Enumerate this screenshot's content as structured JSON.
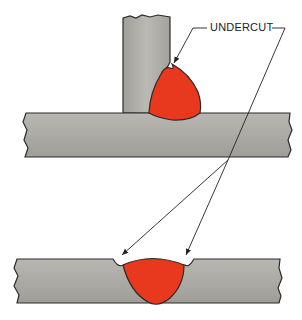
{
  "diagram": {
    "label": "UNDERCUT",
    "colors": {
      "plate": "#a9a8a3",
      "weld": "#e8391e",
      "outline": "#2a2a2a"
    },
    "figures": [
      {
        "name": "fillet-weld-t-joint"
      },
      {
        "name": "groove-weld-butt-joint"
      }
    ]
  }
}
